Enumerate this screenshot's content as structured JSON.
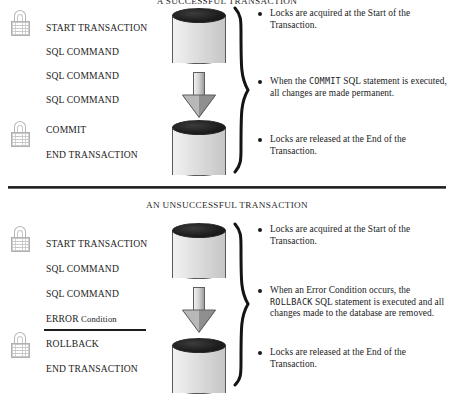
{
  "diagram": {
    "divider": "section-divider"
  },
  "sections": [
    {
      "id": "successful",
      "title": "A SUCCESSFUL TRANSACTION",
      "steps": [
        {
          "label": "START TRANSACTION",
          "locked": true,
          "underlined": false
        },
        {
          "label": "SQL COMMAND",
          "locked": false,
          "underlined": false
        },
        {
          "label": "SQL COMMAND",
          "locked": false,
          "underlined": false
        },
        {
          "label": "SQL COMMAND",
          "locked": false,
          "underlined": false
        },
        {
          "label": "COMMIT",
          "locked": true,
          "underlined": false
        },
        {
          "label": "END TRANSACTION",
          "locked": false,
          "underlined": false
        }
      ],
      "bullets": [
        {
          "lead": "Locks are acquired at the Start of the Transaction.",
          "keyword": "",
          "tail": ""
        },
        {
          "lead": "When the ",
          "keyword": "COMMIT",
          "tail": " SQL statement is executed, all changes are made permanent."
        },
        {
          "lead": "Locks are released at the End of the Transaction.",
          "keyword": "",
          "tail": ""
        }
      ],
      "icons": {
        "db_top": "database-cylinder-icon",
        "db_bottom": "database-cylinder-icon",
        "arrow": "down-arrow-icon",
        "brace": "curly-brace-icon",
        "lock": "padlock-icon"
      }
    },
    {
      "id": "unsuccessful",
      "title": "AN UNSUCCESSFUL TRANSACTION",
      "steps": [
        {
          "label": "START TRANSACTION",
          "locked": true,
          "underlined": false
        },
        {
          "label": "SQL COMMAND",
          "locked": false,
          "underlined": false
        },
        {
          "label": "SQL COMMAND",
          "locked": false,
          "underlined": false
        },
        {
          "label": "ERROR Condition",
          "label_keyword": "ERROR",
          "label_rest": " Condition",
          "locked": false,
          "underlined": true
        },
        {
          "label": "ROLLBACK",
          "locked": true,
          "underlined": false
        },
        {
          "label": "END TRANSACTION",
          "locked": false,
          "underlined": false
        }
      ],
      "bullets": [
        {
          "lead": "Locks are acquired at the Start of the Transaction.",
          "keyword": "",
          "tail": ""
        },
        {
          "lead": "When an Error Condition occurs, the ",
          "keyword": "ROLLBACK",
          "tail": " SQL statement is executed and all changes made to the database are removed."
        },
        {
          "lead": "Locks are released at the End of the Transaction.",
          "keyword": "",
          "tail": ""
        }
      ],
      "icons": {
        "db_top": "database-cylinder-icon",
        "db_bottom": "database-cylinder-icon",
        "arrow": "down-arrow-icon",
        "brace": "curly-brace-icon",
        "lock": "padlock-icon"
      }
    }
  ],
  "colors": {
    "ink": "#1c1c1c",
    "cylinder_top": "#1d1d1d",
    "cylinder_body": "#dcdcdc",
    "arrow_fill": "#b8b8b8",
    "lock_outline": "#b0b0b0",
    "divider": "#1a1a1a"
  }
}
